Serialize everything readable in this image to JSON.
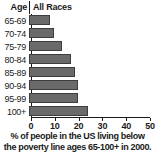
{
  "header": {
    "age_label": "Age",
    "series_label": "All Races"
  },
  "caption": {
    "line1": "% of people in the US living below",
    "line2": "the poverty line ages 65-100+ in 2000."
  },
  "colors": {
    "bar_fill": "#6a6a6a",
    "bar_border": "#3d3d3d",
    "axis": "#1a1a1a",
    "background": "#ffffff"
  },
  "chart_data": {
    "type": "bar",
    "orientation": "horizontal",
    "title": "",
    "subtitle": "",
    "xlabel": "% of people in the US living below the poverty line ages 65-100+ in 2000.",
    "ylabel": "Age",
    "categories": [
      "65-69",
      "70-74",
      "75-79",
      "80-84",
      "85-89",
      "90-94",
      "95-99",
      "100+"
    ],
    "series": [
      {
        "name": "All Races",
        "values": [
          8.8,
          10.5,
          13.9,
          17.6,
          19.3,
          20.5,
          20.7,
          24.8
        ]
      }
    ],
    "xlim": [
      0,
      50
    ],
    "xticks": [
      0,
      10,
      20,
      30,
      40,
      50
    ],
    "xtick_labels": [
      "0",
      "10",
      "20",
      "30",
      "40",
      "50"
    ],
    "grid": false,
    "legend": false
  }
}
